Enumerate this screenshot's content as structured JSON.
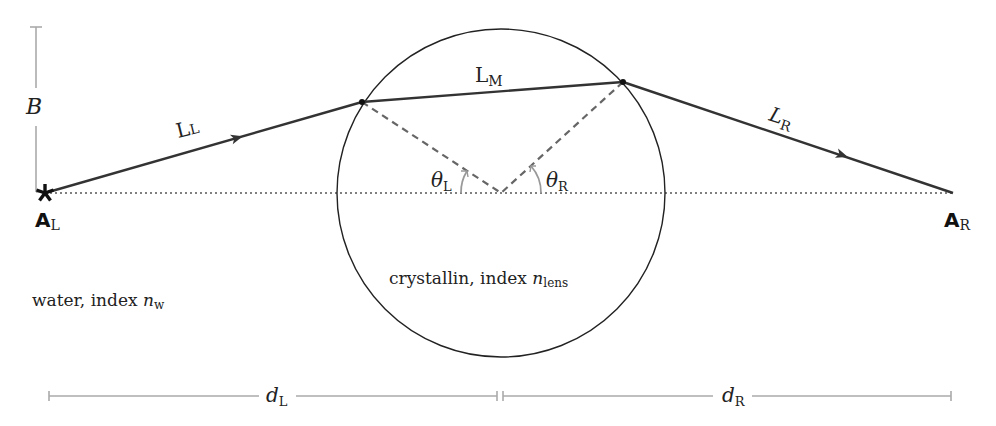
{
  "diagram": {
    "colors": {
      "ray": "#333333",
      "circle": "#222222",
      "axis": "#555555",
      "normals": "#666666",
      "dimension": "#aaaaaa",
      "angle_arc": "#999999"
    },
    "labels": {
      "B": "B",
      "L_L": {
        "main": "L",
        "sub": "L"
      },
      "L_M": {
        "main": "L",
        "sub": "M"
      },
      "L_R": {
        "main": "L",
        "sub": "R"
      },
      "theta_L": {
        "main": "θ",
        "sub": "L"
      },
      "theta_R": {
        "main": "θ",
        "sub": "R"
      },
      "A_L": {
        "main": "A",
        "sub": "L"
      },
      "A_R": {
        "main": "A",
        "sub": "R"
      },
      "d_L": {
        "main": "d",
        "sub": "L"
      },
      "d_R": {
        "main": "d",
        "sub": "R"
      },
      "water": {
        "text": "water, index ",
        "var": "n",
        "sub": "w"
      },
      "lens": {
        "text": "crystallin, index ",
        "var": "n",
        "sub": "lens"
      }
    },
    "geometry": {
      "axis_y": 193,
      "A_L": [
        45,
        193
      ],
      "A_R": [
        953,
        193
      ],
      "lens_center": [
        501,
        193
      ],
      "lens_radius": 164,
      "entry_point": [
        362,
        102
      ],
      "exit_point": [
        623,
        82
      ]
    }
  }
}
